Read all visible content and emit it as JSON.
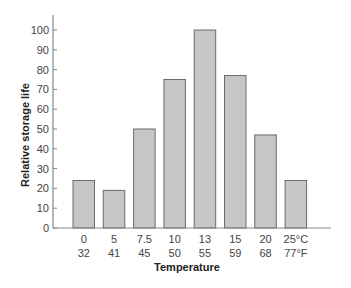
{
  "chart_data": {
    "type": "bar",
    "title": "",
    "xlabel": "Temperature",
    "ylabel": "Relative storage life",
    "categories": [
      "0 / 32",
      "5 / 41",
      "7.5 / 45",
      "10 / 50",
      "13 / 55",
      "15 / 59",
      "20 / 68",
      "25°C / 77°F"
    ],
    "x_labels_celsius": [
      "0",
      "5",
      "7.5",
      "10",
      "13",
      "15",
      "20",
      "25°C"
    ],
    "x_labels_fahrenheit": [
      "32",
      "41",
      "45",
      "50",
      "55",
      "59",
      "68",
      "77°F"
    ],
    "values": [
      24,
      19,
      50,
      75,
      100,
      77,
      47,
      24
    ],
    "ylim": [
      0,
      100
    ],
    "yticks": [
      0,
      10,
      20,
      30,
      40,
      50,
      60,
      70,
      80,
      90,
      100
    ],
    "grid": false,
    "legend": null,
    "colors": {
      "bar_fill": "#c6c6c6",
      "bar_stroke": "#6a6a6a",
      "axis": "#888888"
    }
  }
}
